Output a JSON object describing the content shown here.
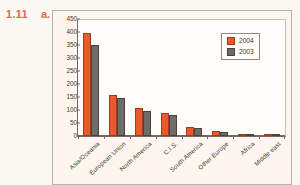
{
  "exercise": {
    "number": "1.11",
    "part": "a."
  },
  "colors": {
    "series_2004": "#e85a2d",
    "series_2003": "#6e6b68",
    "panel_bg": "#fdf6ef",
    "page_bg": "#fbf8f4",
    "label_color": "#e4674a"
  },
  "chart_data": {
    "type": "bar",
    "title": "",
    "subtitle": "",
    "xlabel": "",
    "ylabel": "",
    "ylim": [
      0,
      450
    ],
    "yticks": [
      450,
      400,
      350,
      300,
      250,
      200,
      150,
      100,
      50,
      0
    ],
    "grid": false,
    "legend_position": "top-right",
    "categories": [
      "Asia/Oceania",
      "European Union",
      "North America",
      "C.I.S.",
      "South America",
      "Other Europe",
      "Africa",
      "Middle east"
    ],
    "series": [
      {
        "name": "2004",
        "color": "#e85a2d",
        "values": [
          395,
          158,
          107,
          88,
          33,
          20,
          8,
          6
        ]
      },
      {
        "name": "2003",
        "color": "#6e6b68",
        "values": [
          350,
          148,
          97,
          82,
          30,
          17,
          7,
          5
        ]
      }
    ]
  }
}
